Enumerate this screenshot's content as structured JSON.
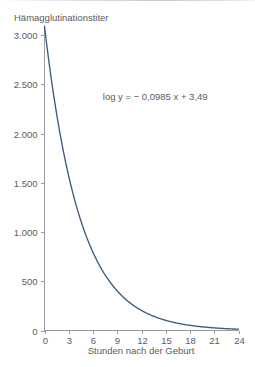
{
  "chart_data": {
    "type": "line",
    "title": "",
    "ylabel": "Hämagglutinationstiter",
    "xlabel": "Stunden nach der Geburt",
    "xlim": [
      0,
      24
    ],
    "ylim": [
      0,
      3000
    ],
    "grid": false,
    "legend": null,
    "xticks": [
      0,
      3,
      6,
      9,
      12,
      15,
      18,
      21,
      24
    ],
    "xtick_labels": [
      "0",
      "3",
      "6",
      "9",
      "12",
      "15",
      "18",
      "21",
      "24"
    ],
    "yticks": [
      0,
      500,
      1000,
      1500,
      2000,
      2500,
      3000
    ],
    "ytick_labels": [
      "0",
      "500",
      "1.000",
      "1.500",
      "2.000",
      "2.500",
      "3.000"
    ],
    "annotations": [
      {
        "text": "log y = − 0,0985 x + 3,49",
        "x": 13.7,
        "y": 2340
      }
    ],
    "series": [
      {
        "name": "Hämagglutinationstiter",
        "color": "#3d5a80",
        "equation": "log10(y) = -0.0985 * x + 3.49",
        "x": [
          0,
          1,
          2,
          3,
          4,
          5,
          6,
          7,
          8,
          9,
          10,
          11,
          12,
          13,
          14,
          15,
          16,
          17,
          18,
          19,
          20,
          21,
          22,
          23,
          24
        ],
        "values": [
          3090,
          2462,
          1962,
          1563,
          1245,
          992,
          790,
          630,
          502,
          400,
          318,
          254,
          202,
          161,
          128,
          102,
          81,
          65,
          52,
          41,
          33,
          26,
          21,
          17,
          13
        ]
      }
    ]
  },
  "axis_titles": {
    "y": "Hämagglutinationstiter",
    "x": "Stunden nach der Geburt"
  },
  "annotation": {
    "equation": "log y = − 0,0985 x + 3,49"
  },
  "colors": {
    "curve": "#3d5a80",
    "axis": "#9a9aa0",
    "text": "#5b5b60",
    "background": "#ffffff"
  }
}
